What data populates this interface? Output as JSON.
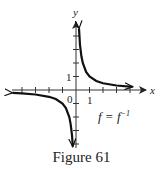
{
  "figure": {
    "caption": "Figure 61",
    "annotation": "f = f⁻¹"
  },
  "chart_data": {
    "type": "line",
    "title": "",
    "function": "f(x) = 1/x",
    "xlabel": "x",
    "ylabel": "y",
    "origin_label": "0",
    "x_tick_label": "1",
    "y_tick_label": "1",
    "xlim": [
      -4.7,
      5.1
    ],
    "ylim": [
      -4.2,
      4.9
    ],
    "x_ticks": [
      -4,
      -3,
      -2,
      -1,
      1,
      2,
      3,
      4
    ],
    "y_ticks": [
      -4,
      -3,
      -2,
      -1,
      1,
      2,
      3,
      4
    ],
    "grid": false,
    "legend": null,
    "annotation": "f = f^-1",
    "series": [
      {
        "name": "branch-positive",
        "x": [
          0.22,
          0.3,
          0.4,
          0.5,
          0.75,
          1,
          1.5,
          2,
          3,
          4.2
        ],
        "y": [
          4.55,
          3.33,
          2.5,
          2.0,
          1.33,
          1.0,
          0.67,
          0.5,
          0.33,
          0.24
        ]
      },
      {
        "name": "branch-negative",
        "x": [
          -4.7,
          -4,
          -3,
          -2,
          -1.5,
          -1,
          -0.75,
          -0.5,
          -0.4,
          -0.3,
          -0.24
        ],
        "y": [
          -0.21,
          -0.25,
          -0.33,
          -0.5,
          -0.67,
          -1.0,
          -1.33,
          -2.0,
          -2.5,
          -3.33,
          -4.2
        ]
      }
    ],
    "color": "#111111"
  }
}
